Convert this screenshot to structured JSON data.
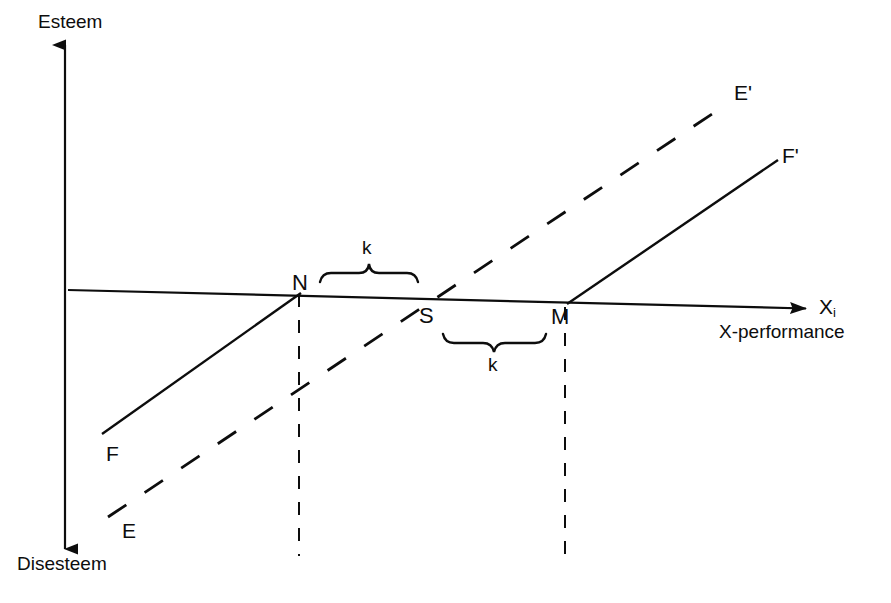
{
  "figure": {
    "type": "line-diagram",
    "background": "#ffffff",
    "stroke_color": "#0d0d0d",
    "width": 891,
    "height": 603,
    "axes": {
      "vertical": {
        "top_label": "Esteem",
        "bottom_label": "Disesteem",
        "x": 65,
        "y_top": 43,
        "y_bottom": 550,
        "arrow_both_ends": true
      },
      "horizontal": {
        "symbol": "X",
        "subscript": "i",
        "caption": "X-performance",
        "x_start": 68,
        "x_end": 812,
        "y_start": 290,
        "y_end": 309,
        "arrow_end": true
      }
    },
    "curves": [
      {
        "id": "F",
        "style": "solid",
        "start_label": "F",
        "end_label": "F'",
        "segments": [
          {
            "x1": 102,
            "y1": 434,
            "x2": 300,
            "y2": 293
          },
          {
            "x1": 568,
            "y1": 304,
            "x2": 778,
            "y2": 160
          }
        ],
        "start_label_pos": {
          "x": 106,
          "y": 443
        },
        "end_label_pos": {
          "x": 782,
          "y": 145
        }
      },
      {
        "id": "E",
        "style": "dashed",
        "start_label": "E",
        "end_label": "E'",
        "dash": "20 20",
        "segments": [
          {
            "x1": 108,
            "y1": 517,
            "x2": 726,
            "y2": 105
          }
        ],
        "start_label_pos": {
          "x": 122,
          "y": 520
        },
        "end_label_pos": {
          "x": 734,
          "y": 82
        }
      }
    ],
    "points": [
      {
        "label": "N",
        "x": 300,
        "y": 292,
        "label_pos": {
          "x": 292,
          "y": 272
        },
        "dropline": {
          "x": 299,
          "y_top": 294,
          "y_bottom": 556
        }
      },
      {
        "label": "S",
        "x": 424,
        "y": 300,
        "label_pos": {
          "x": 419,
          "y": 305
        },
        "dropline": null
      },
      {
        "label": "M",
        "x": 566,
        "y": 304,
        "label_pos": {
          "x": 551,
          "y": 306
        },
        "dropline": {
          "x": 565,
          "y_top": 306,
          "y_bottom": 556
        }
      }
    ],
    "braces": [
      {
        "label": "k",
        "orientation": "up",
        "x_start": 320,
        "x_end": 418,
        "y": 282,
        "label_pos": {
          "x": 362,
          "y": 238
        }
      },
      {
        "label": "k",
        "orientation": "down",
        "x_start": 443,
        "x_end": 546,
        "y": 334,
        "label_pos": {
          "x": 488,
          "y": 355
        }
      }
    ]
  }
}
